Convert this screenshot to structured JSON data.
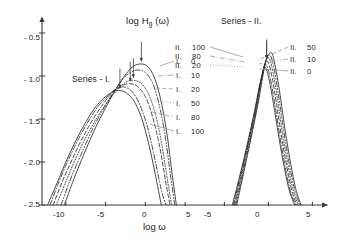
{
  "figure": {
    "axis_label_y": "log H",
    "axis_label_y_sub": "g",
    "axis_label_y_tail": " (ω)",
    "axis_label_x": "log ω"
  },
  "panels": {
    "left": {
      "title": "Series - I.",
      "xticks": [
        "-10",
        "-5",
        "0",
        "5"
      ],
      "legend": [
        {
          "roman": "I.",
          "value": "0"
        },
        {
          "roman": "I.",
          "value": "10"
        },
        {
          "roman": "I.",
          "value": "20"
        },
        {
          "roman": "I.",
          "value": "50"
        },
        {
          "roman": "I.",
          "value": "80"
        },
        {
          "roman": "I.",
          "value": "100"
        }
      ]
    },
    "right": {
      "title": "Series - II.",
      "xticks": [
        "-5",
        "0",
        "5"
      ],
      "legend_left": [
        {
          "roman": "II.",
          "value": "100"
        },
        {
          "roman": "II.",
          "value": "80"
        },
        {
          "roman": "II.",
          "value": "20"
        }
      ],
      "legend_right": [
        {
          "roman": "II.",
          "value": "50"
        },
        {
          "roman": "II.",
          "value": "10"
        },
        {
          "roman": "II.",
          "value": "0"
        }
      ]
    }
  },
  "yticks": [
    "- 0.5",
    "- 1.0",
    "- 1.5",
    "- 2.0",
    "- 2.5"
  ],
  "colors": {
    "ink": "#1a1a1a",
    "axis": "#3a3a3a",
    "curve": "#2b2b2b",
    "leader": "#8c8c8c"
  },
  "chart_data": {
    "type": "line",
    "title": "",
    "xlabel": "log ω",
    "ylabel": "log H̄_g(ω)",
    "ylim": [
      -2.5,
      -0.35
    ],
    "grid": false,
    "legend_position": "inside-right",
    "panels": [
      {
        "name": "Series - I.",
        "xlim": [
          -12.5,
          6.5
        ],
        "xticks": [
          -10,
          -5,
          0,
          5
        ],
        "yticks": [
          -0.5,
          -1.0,
          -1.5,
          -2.0,
          -2.5
        ],
        "series": [
          {
            "name": "I. 0",
            "style": "solid",
            "peak_x": -3.2,
            "peak_y": -1.17,
            "width": 5.6,
            "arrow": true,
            "x": [
              -12.3,
              -11,
              -10,
              -9,
              -8,
              -7,
              -6,
              -5,
              -4,
              -3.2,
              -2.5,
              -1.5,
              -0.5,
              0.4,
              1.2,
              2.0
            ],
            "y": [
              -2.5,
              -2.22,
              -2.0,
              -1.8,
              -1.62,
              -1.46,
              -1.33,
              -1.24,
              -1.18,
              -1.17,
              -1.19,
              -1.28,
              -1.48,
              -1.78,
              -2.12,
              -2.5
            ]
          },
          {
            "name": "I. 10",
            "style": "dashdot",
            "peak_x": -2.6,
            "peak_y": -1.13,
            "width": 5.4,
            "arrow": false,
            "x": [
              -12.0,
              -11,
              -10,
              -9,
              -8,
              -7,
              -6,
              -5,
              -4,
              -3,
              -2.6,
              -1.8,
              -0.8,
              0.2,
              1.0,
              2.0,
              2.6
            ],
            "y": [
              -2.5,
              -2.26,
              -2.04,
              -1.84,
              -1.66,
              -1.5,
              -1.36,
              -1.26,
              -1.17,
              -1.13,
              -1.13,
              -1.17,
              -1.31,
              -1.57,
              -1.88,
              -2.32,
              -2.5
            ]
          },
          {
            "name": "I. 20",
            "style": "dashed",
            "peak_x": -1.9,
            "peak_y": -1.09,
            "width": 5.1,
            "arrow": true,
            "x": [
              -11.6,
              -10.5,
              -9.5,
              -8.5,
              -7.5,
              -6.5,
              -5.5,
              -4.5,
              -3.5,
              -2.6,
              -1.9,
              -1.0,
              0.0,
              0.9,
              1.8,
              2.6,
              3.1
            ],
            "y": [
              -2.5,
              -2.24,
              -2.03,
              -1.83,
              -1.65,
              -1.49,
              -1.35,
              -1.23,
              -1.14,
              -1.1,
              -1.09,
              -1.12,
              -1.24,
              -1.47,
              -1.82,
              -2.25,
              -2.5
            ]
          },
          {
            "name": "I. 50",
            "style": "dotted",
            "peak_x": -1.5,
            "peak_y": -1.05,
            "width": 4.8,
            "arrow": true,
            "x": [
              -11.2,
              -10,
              -9,
              -8,
              -7,
              -6,
              -5,
              -4,
              -3,
              -2.2,
              -1.5,
              -0.6,
              0.3,
              1.2,
              2.0,
              2.8,
              3.3
            ],
            "y": [
              -2.5,
              -2.23,
              -2.01,
              -1.81,
              -1.63,
              -1.47,
              -1.33,
              -1.21,
              -1.11,
              -1.06,
              -1.05,
              -1.08,
              -1.19,
              -1.42,
              -1.76,
              -2.22,
              -2.5
            ]
          },
          {
            "name": "I. 80",
            "style": "dashdotdot",
            "peak_x": -0.9,
            "peak_y": -0.93,
            "width": 4.4,
            "arrow": false,
            "x": [
              -10.6,
              -9.5,
              -8.5,
              -7.5,
              -6.5,
              -5.5,
              -4.5,
              -3.5,
              -2.6,
              -1.7,
              -0.9,
              0.0,
              0.9,
              1.7,
              2.5,
              3.2,
              3.7
            ],
            "y": [
              -2.5,
              -2.22,
              -2.0,
              -1.79,
              -1.59,
              -1.42,
              -1.26,
              -1.12,
              -1.01,
              -0.95,
              -0.93,
              -0.96,
              -1.08,
              -1.32,
              -1.7,
              -2.18,
              -2.5
            ]
          },
          {
            "name": "I. 100",
            "style": "solid",
            "peak_x": -0.5,
            "peak_y": -0.86,
            "width": 4.1,
            "arrow": true,
            "x": [
              -10.2,
              -9,
              -8,
              -7,
              -6,
              -5,
              -4,
              -3,
              -2.2,
              -1.4,
              -0.5,
              0.3,
              1.1,
              1.9,
              2.7,
              3.4,
              3.9
            ],
            "y": [
              -2.5,
              -2.2,
              -1.97,
              -1.75,
              -1.55,
              -1.37,
              -1.2,
              -1.05,
              -0.95,
              -0.88,
              -0.86,
              -0.89,
              -1.01,
              -1.26,
              -1.66,
              -2.16,
              -2.5
            ]
          }
        ]
      },
      {
        "name": "Series - II.",
        "xlim": [
          -8.0,
          7.0
        ],
        "xticks": [
          -5,
          0,
          5
        ],
        "yticks": [
          -0.5,
          -1.0,
          -1.5,
          -2.0,
          -2.5
        ],
        "series": [
          {
            "name": "II. 100",
            "style": "solid",
            "peak_x": -0.45,
            "peak_y": -0.9,
            "width": 1.55,
            "arrow": false,
            "x": [
              -4.1,
              -3.4,
              -2.8,
              -2.2,
              -1.6,
              -1.1,
              -0.7,
              -0.45,
              -0.2,
              0.2,
              0.7,
              1.2,
              1.8,
              2.4,
              3.0
            ],
            "y": [
              -2.5,
              -2.22,
              -1.97,
              -1.7,
              -1.42,
              -1.16,
              -0.98,
              -0.9,
              -0.93,
              -1.1,
              -1.4,
              -1.72,
              -2.06,
              -2.34,
              -2.5
            ]
          },
          {
            "name": "II. 80",
            "style": "dashdot",
            "peak_x": -0.35,
            "peak_y": -0.87,
            "width": 1.55,
            "arrow": false,
            "x": [
              -4.0,
              -3.3,
              -2.7,
              -2.1,
              -1.5,
              -1.0,
              -0.6,
              -0.35,
              -0.1,
              0.3,
              0.8,
              1.3,
              1.9,
              2.5,
              3.1
            ],
            "y": [
              -2.5,
              -2.21,
              -1.95,
              -1.68,
              -1.39,
              -1.12,
              -0.94,
              -0.87,
              -0.9,
              -1.07,
              -1.37,
              -1.7,
              -2.05,
              -2.34,
              -2.5
            ]
          },
          {
            "name": "II. 50",
            "style": "dashed",
            "peak_x": -0.2,
            "peak_y": -0.83,
            "width": 1.55,
            "arrow": true,
            "x": [
              -3.9,
              -3.2,
              -2.6,
              -2.0,
              -1.4,
              -0.9,
              -0.5,
              -0.2,
              0.05,
              0.45,
              0.95,
              1.45,
              2.05,
              2.65,
              3.25
            ],
            "y": [
              -2.5,
              -2.2,
              -1.93,
              -1.65,
              -1.36,
              -1.08,
              -0.89,
              -0.83,
              -0.86,
              -1.03,
              -1.34,
              -1.68,
              -2.03,
              -2.33,
              -2.5
            ]
          },
          {
            "name": "II. 20",
            "style": "dotted",
            "peak_x": -0.05,
            "peak_y": -0.79,
            "width": 1.55,
            "arrow": false,
            "x": [
              -3.8,
              -3.1,
              -2.5,
              -1.9,
              -1.3,
              -0.8,
              -0.4,
              -0.05,
              0.2,
              0.6,
              1.1,
              1.6,
              2.2,
              2.8,
              3.4
            ],
            "y": [
              -2.5,
              -2.19,
              -1.91,
              -1.63,
              -1.33,
              -1.04,
              -0.85,
              -0.79,
              -0.82,
              -1.0,
              -1.31,
              -1.66,
              -2.02,
              -2.32,
              -2.5
            ]
          },
          {
            "name": "II. 10",
            "style": "dashdotdot",
            "peak_x": 0.1,
            "peak_y": -0.76,
            "width": 1.55,
            "arrow": false,
            "x": [
              -3.7,
              -3.0,
              -2.4,
              -1.8,
              -1.2,
              -0.7,
              -0.25,
              0.1,
              0.35,
              0.75,
              1.25,
              1.75,
              2.35,
              2.95,
              3.55
            ],
            "y": [
              -2.5,
              -2.18,
              -1.9,
              -1.61,
              -1.3,
              -1.01,
              -0.81,
              -0.76,
              -0.79,
              -0.97,
              -1.29,
              -1.64,
              -2.01,
              -2.31,
              -2.5
            ]
          },
          {
            "name": "II. 0",
            "style": "solid",
            "peak_x": 0.25,
            "peak_y": -0.73,
            "width": 1.55,
            "arrow": false,
            "x": [
              -3.6,
              -2.9,
              -2.3,
              -1.7,
              -1.1,
              -0.6,
              -0.15,
              0.25,
              0.5,
              0.9,
              1.4,
              1.9,
              2.5,
              3.1,
              3.7
            ],
            "y": [
              -2.5,
              -2.17,
              -1.88,
              -1.59,
              -1.28,
              -0.98,
              -0.78,
              -0.73,
              -0.76,
              -0.95,
              -1.27,
              -1.63,
              -2.0,
              -2.31,
              -2.5
            ]
          }
        ]
      }
    ]
  }
}
